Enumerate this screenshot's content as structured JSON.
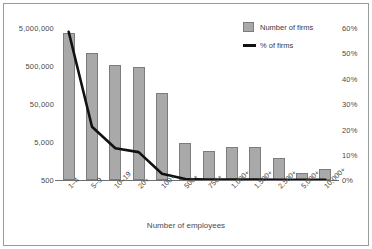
{
  "chart_data": {
    "type": "bar",
    "title": "",
    "subtitle": "",
    "xlabel": "Number of employees",
    "ylabel": "",
    "ylabel_right": "",
    "grid": false,
    "legend_position": "top-right",
    "categories": [
      "1–4",
      "5–9",
      "10–19",
      "20+",
      "100+",
      "500+",
      "750+",
      "1,000+",
      "1,500+",
      "2,500+",
      "5,000+",
      "10,000+"
    ],
    "yaxis_left": {
      "scale": "log",
      "ticks": [
        "500",
        "5,000",
        "50,000",
        "500,000",
        "5,000,000"
      ],
      "tick_values": [
        500,
        5000,
        50000,
        500000,
        5000000
      ],
      "ylim": [
        500,
        5000000
      ]
    },
    "yaxis_right": {
      "scale": "linear",
      "ticks": [
        "0%",
        "10%",
        "20%",
        "30%",
        "40%",
        "50%",
        "60%"
      ],
      "tick_values": [
        0,
        10,
        20,
        30,
        40,
        50,
        60
      ],
      "ylim": [
        0,
        60
      ]
    },
    "series": [
      {
        "name": "Number of firms",
        "type": "bar",
        "axis": "left",
        "color": "#a9a9a9",
        "values": [
          3600000,
          1100000,
          530000,
          470000,
          95000,
          4800,
          2900,
          3600,
          3600,
          1900,
          750,
          950
        ]
      },
      {
        "name": "% of firms",
        "type": "line",
        "axis": "right",
        "color": "#111111",
        "values": [
          58.5,
          21.0,
          12.5,
          11.0,
          2.5,
          0.4,
          0.2,
          0.2,
          0.15,
          0.1,
          0.1,
          0.1
        ]
      }
    ]
  },
  "legend": {
    "items": [
      {
        "label": "Number of firms",
        "marker": "bar-swatch"
      },
      {
        "label": "% of firms",
        "marker": "line-swatch"
      }
    ]
  },
  "axis_titles": {
    "x": "Number of employees"
  }
}
